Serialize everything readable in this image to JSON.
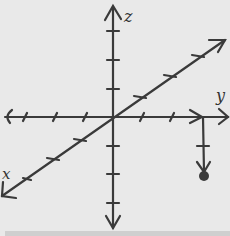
{
  "diagram": {
    "type": "hand-drawn 3D coordinate axes",
    "colors": {
      "background": "#e9e9e9",
      "ink": "#3a3a3a",
      "strip": "#cfcfcf"
    },
    "labels": {
      "z_axis": "z",
      "y_axis": "y",
      "x_axis": "x"
    },
    "origin": [
      113,
      117
    ],
    "axes": {
      "z": {
        "from": [
          113,
          228
        ],
        "to": [
          113,
          6
        ],
        "ticks_y": [
          31,
          60,
          89,
          146,
          174,
          203
        ]
      },
      "horizontal": {
        "from": [
          5,
          117
        ],
        "to": [
          228,
          117
        ],
        "ticks_x": [
          25,
          55,
          85,
          145,
          175
        ]
      },
      "diagonal": {
        "from": [
          2,
          196
        ],
        "to": [
          225,
          40
        ],
        "ticks": [
          [
            35,
            173
          ],
          [
            53,
            160
          ],
          [
            80,
            141
          ],
          [
            140,
            98
          ],
          [
            170,
            77
          ],
          [
            198,
            57
          ]
        ]
      }
    },
    "vector": {
      "start": [
        203,
        117
      ],
      "end": [
        204,
        175
      ],
      "tick": [
        203,
        146
      ],
      "point": [
        204,
        176
      ]
    }
  }
}
